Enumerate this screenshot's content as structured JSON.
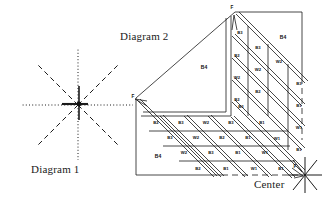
{
  "figure": {
    "kind": "technical-line-diagram",
    "background": "#ffffff",
    "ink": "#111111"
  },
  "diagram1": {
    "caption": "Diagram 1",
    "description": "eight-ray star of dotted and dashed construction lines meeting at a central node",
    "center": {
      "x": 78,
      "y": 105
    },
    "rays": [
      {
        "name": "ray-north",
        "style": "dotted"
      },
      {
        "name": "ray-south",
        "style": "dotted"
      },
      {
        "name": "ray-east",
        "style": "dotted"
      },
      {
        "name": "ray-west",
        "style": "dotted"
      },
      {
        "name": "ray-northeast",
        "style": "dashed"
      },
      {
        "name": "ray-southwest",
        "style": "dashed"
      },
      {
        "name": "ray-northwest",
        "style": "dashed"
      },
      {
        "name": "ray-southeast",
        "style": "dashed"
      }
    ]
  },
  "diagram2": {
    "caption": "Diagram 2",
    "center_label": "Center",
    "apex_marker": "F",
    "left_marker": "F",
    "center_marker": "F",
    "outline_note": "L-shaped stepped field bounded by solid and dashed edges",
    "large_regions": [
      {
        "name": "region-upper-left",
        "label": "B4"
      },
      {
        "name": "region-upper-right",
        "label": "B4"
      },
      {
        "name": "region-lower-left",
        "label": "B4"
      }
    ],
    "band_cells": {
      "vertical_arm": [
        [
          "B3"
        ],
        [
          "B2",
          "B3"
        ],
        [
          "W2",
          "W2"
        ],
        [
          "B2",
          "B2"
        ],
        [
          "B3",
          "B1"
        ]
      ],
      "right_column": [
        "B3",
        "B1",
        "W1",
        "B1"
      ],
      "diagonal_rows": [
        [
          "B2",
          "B3",
          "W2",
          "B3",
          "B3"
        ],
        [
          "B3",
          "W2",
          "B2",
          "B1",
          "B1"
        ],
        [
          "W2",
          "B3",
          "B1",
          "W1",
          "W1"
        ],
        [
          "B2",
          "B1",
          "W1",
          "B1",
          "B1"
        ]
      ]
    },
    "all_cell_labels": [
      "B3",
      "B2",
      "B3",
      "W2",
      "W2",
      "B2",
      "B2",
      "B3",
      "B1",
      "B2",
      "B3",
      "W2",
      "B3",
      "B3",
      "B3",
      "W2",
      "B2",
      "B1",
      "B1",
      "W2",
      "B3",
      "B1",
      "W1",
      "W1",
      "B2",
      "B1",
      "W1",
      "B1",
      "B1",
      "B3",
      "B1",
      "W1",
      "B1",
      "B4",
      "B4",
      "B4"
    ]
  }
}
